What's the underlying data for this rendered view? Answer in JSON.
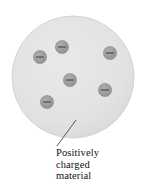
{
  "figure": {
    "sphere": {
      "name": "positively-charged-material-sphere",
      "center_x": 73,
      "center_y": 77,
      "radius": 61,
      "fill": "#e2e2e0",
      "stroke": "#d2d2d0"
    },
    "electrons": {
      "count": 6,
      "radius": 6.6,
      "fill": "#9a9a9a",
      "stroke": "#8a8a8a",
      "sign": "−",
      "sign_color": "#3b3b3b",
      "positions": [
        {
          "label": "electron-1",
          "x": 40,
          "y": 57
        },
        {
          "label": "electron-2",
          "x": 62,
          "y": 47
        },
        {
          "label": "electron-3",
          "x": 110,
          "y": 53
        },
        {
          "label": "electron-4",
          "x": 70,
          "y": 80
        },
        {
          "label": "electron-5",
          "x": 105,
          "y": 90
        },
        {
          "label": "electron-6",
          "x": 47,
          "y": 102
        }
      ]
    },
    "leader_line": {
      "name": "callout-leader-line",
      "x1": 57,
      "y1": 146,
      "x2": 76,
      "y2": 120,
      "color": "#4a4a4a"
    },
    "caption": {
      "line1": "Positively",
      "line2": "charged",
      "line3": "material"
    }
  }
}
